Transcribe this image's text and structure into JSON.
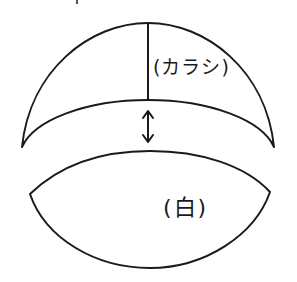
{
  "diagram": {
    "upper_piece": {
      "label": "(カラシ)",
      "color_meaning": "mustard"
    },
    "lower_piece": {
      "label": "(白)",
      "color_meaning": "white"
    },
    "connector": {
      "icon": "double-headed-vertical-arrow"
    },
    "stroke_color": "#1a1a1a",
    "background_color": "#ffffff"
  }
}
